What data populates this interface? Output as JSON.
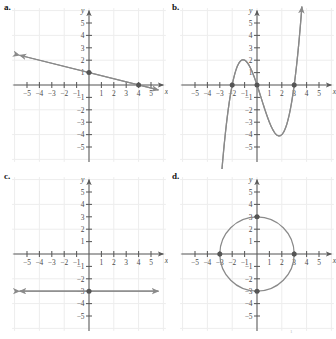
{
  "figure": {
    "width": 336,
    "height": 339,
    "background": "#ffffff",
    "curve_color": "#8a8a8a",
    "axis_color": "#5a5a5a",
    "grid_color": "#ededed",
    "marker_color": "#555555",
    "label_color": "#4a4a4a",
    "footnote_mark": "1"
  },
  "axes_common": {
    "x_label": "x",
    "y_label": "y",
    "xlim": [
      -6,
      6
    ],
    "ylim": [
      -6,
      6
    ],
    "x_ticks": [
      -5,
      -4,
      -3,
      -2,
      -1,
      1,
      2,
      3,
      4,
      5
    ],
    "y_ticks": [
      -5,
      -4,
      -3,
      -2,
      -1,
      1,
      2,
      3,
      4,
      5
    ],
    "x_tick_labels": [
      "-5",
      "-4",
      "-3",
      "-2",
      "-1",
      "1",
      "2",
      "3",
      "4",
      "5"
    ],
    "y_tick_labels": [
      "-5",
      "-4",
      "-3",
      "-2",
      "-1",
      "1",
      "2",
      "3",
      "4",
      "5"
    ],
    "grid": true,
    "grid_step": 2
  },
  "panels": [
    {
      "id": "a",
      "label": "a.",
      "chart_data": {
        "type": "line",
        "title": "",
        "xlabel": "x",
        "ylabel": "y",
        "xlim": [
          -6,
          6
        ],
        "ylim": [
          -6,
          6
        ],
        "grid": true,
        "equation": "y = -0.25x + 1",
        "series": [
          {
            "name": "linear",
            "kind": "line",
            "slope": -0.25,
            "intercept": 1,
            "x_start": -5.6,
            "x_end": 5.6,
            "arrow_start": true,
            "arrow_end": true
          }
        ],
        "points": [
          {
            "x": 0,
            "y": 1,
            "label": "y-intercept"
          },
          {
            "x": 4,
            "y": 0,
            "label": "x-intercept"
          }
        ]
      }
    },
    {
      "id": "b",
      "label": "b.",
      "chart_data": {
        "type": "line",
        "title": "",
        "xlabel": "x",
        "ylabel": "y",
        "xlim": [
          -6,
          6
        ],
        "ylim": [
          -6,
          6
        ],
        "grid": true,
        "equation": "y = 0.5x(x + 2)(x - 3)",
        "series": [
          {
            "name": "cubic",
            "kind": "cubic",
            "roots": [
              -2,
              0,
              3
            ],
            "leading_coefficient": 0.5,
            "local_max": {
              "x": -1.21,
              "y": 2.1
            },
            "local_min": {
              "x": 2.0,
              "y": -4.1
            },
            "x_start": -2.95,
            "x_end": 3.62,
            "arrow_start": true,
            "arrow_end": true
          }
        ],
        "points": [
          {
            "x": -2,
            "y": 0,
            "label": "x-intercept"
          },
          {
            "x": 0,
            "y": 0,
            "label": "origin-intercept"
          },
          {
            "x": 3,
            "y": 0,
            "label": "x-intercept"
          }
        ]
      }
    },
    {
      "id": "c",
      "label": "c.",
      "chart_data": {
        "type": "line",
        "title": "",
        "xlabel": "x",
        "ylabel": "y",
        "xlim": [
          -6,
          6
        ],
        "ylim": [
          -6,
          6
        ],
        "grid": true,
        "equation": "y = -3",
        "series": [
          {
            "name": "horizontal",
            "kind": "line",
            "slope": 0,
            "intercept": -3,
            "x_start": -5.6,
            "x_end": 5.6,
            "arrow_start": true,
            "arrow_end": true
          }
        ],
        "points": [
          {
            "x": 0,
            "y": -3,
            "label": "y-intercept"
          }
        ]
      }
    },
    {
      "id": "d",
      "label": "d.",
      "chart_data": {
        "type": "scatter",
        "title": "",
        "xlabel": "x",
        "ylabel": "y",
        "xlim": [
          -6,
          6
        ],
        "ylim": [
          -6,
          6
        ],
        "grid": true,
        "equation": "x^2 + y^2 = 9",
        "series": [
          {
            "name": "circle",
            "kind": "circle",
            "center": [
              0,
              0
            ],
            "radius": 3
          }
        ],
        "points": [
          {
            "x": -3,
            "y": 0,
            "label": "left-intercept"
          },
          {
            "x": 3,
            "y": 0,
            "label": "right-intercept"
          },
          {
            "x": 0,
            "y": 3,
            "label": "top-intercept"
          },
          {
            "x": 0,
            "y": -3,
            "label": "bottom-intercept"
          }
        ]
      }
    }
  ]
}
